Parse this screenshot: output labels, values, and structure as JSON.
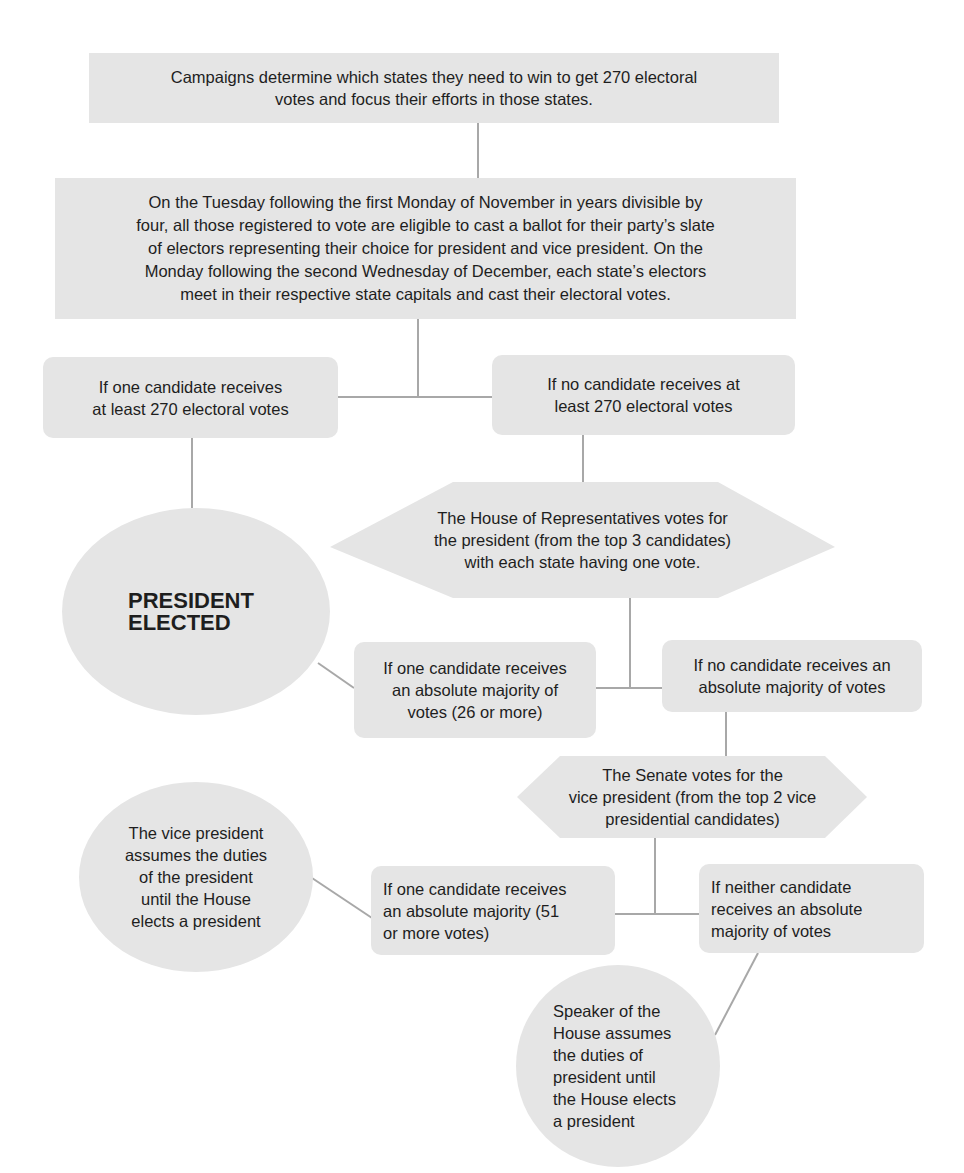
{
  "diagram": {
    "type": "flowchart",
    "colors": {
      "node_fill": "#e5e5e5",
      "connector": "#a8a8a8",
      "text": "#1e1e1e"
    },
    "nodes": {
      "campaigns": {
        "shape": "rectangle",
        "text": "Campaigns determine which states they need to win to get 270 electoral\nvotes and focus their efforts in those states."
      },
      "election_day": {
        "shape": "rectangle",
        "text": "On the Tuesday following the first Monday of November in years divisible by\nfour, all those registered to vote are eligible to cast a ballot for their party’s slate\nof electors representing their choice for president and vice president. On the\nMonday following the second Wednesday of December, each state’s electors\nmeet in their respective state capitals and cast their electoral votes."
      },
      "win_270": {
        "shape": "rounded-rectangle",
        "text": "If one candidate receives\nat least 270 electoral votes"
      },
      "no_270": {
        "shape": "rounded-rectangle",
        "text": "If no candidate receives at\nleast 270 electoral votes"
      },
      "president_elected": {
        "shape": "ellipse",
        "text": "PRESIDENT\nELECTED"
      },
      "house_vote": {
        "shape": "hexagon",
        "text": "The House of Representatives votes for\nthe president (from the top 3 candidates)\nwith each state having one vote."
      },
      "house_majority": {
        "shape": "rounded-rectangle",
        "text": "If one candidate receives\nan absolute majority of\nvotes (26 or more)"
      },
      "house_no_majority": {
        "shape": "rounded-rectangle",
        "text": "If  no candidate receives an\nabsolute majority of votes"
      },
      "senate_vote": {
        "shape": "hexagon",
        "text": "The Senate votes for the\nvice president (from the top 2 vice\npresidential candidates)"
      },
      "vp_acts": {
        "shape": "ellipse",
        "text": "The vice president\nassumes the duties\nof the president\nuntil the House\nelects a president"
      },
      "senate_majority": {
        "shape": "rounded-rectangle",
        "text": "If one candidate receives\nan absolute majority (51\nor more votes)"
      },
      "senate_no_majority": {
        "shape": "rounded-rectangle",
        "text": "If neither candidate\nreceives an absolute\nmajority of votes"
      },
      "speaker_acts": {
        "shape": "ellipse",
        "text": "Speaker of the\nHouse assumes\nthe duties of\npresident until\nthe House elects\na president"
      }
    },
    "edges": [
      [
        "campaigns",
        "election_day"
      ],
      [
        "election_day",
        "win_270"
      ],
      [
        "election_day",
        "no_270"
      ],
      [
        "win_270",
        "president_elected"
      ],
      [
        "no_270",
        "house_vote"
      ],
      [
        "house_vote",
        "house_majority"
      ],
      [
        "house_vote",
        "house_no_majority"
      ],
      [
        "house_majority",
        "president_elected"
      ],
      [
        "house_no_majority",
        "senate_vote"
      ],
      [
        "senate_vote",
        "senate_majority"
      ],
      [
        "senate_vote",
        "senate_no_majority"
      ],
      [
        "senate_majority",
        "vp_acts"
      ],
      [
        "senate_no_majority",
        "speaker_acts"
      ]
    ]
  }
}
